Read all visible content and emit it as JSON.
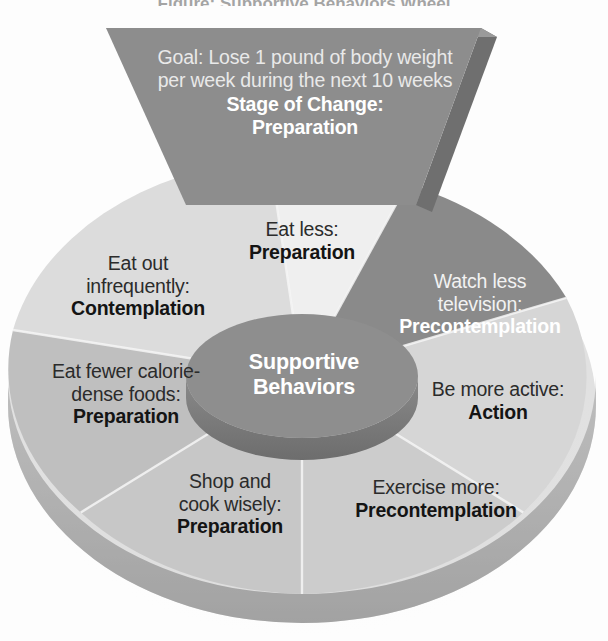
{
  "title": "Figure: Supportive Behaviors Wheel",
  "funnel": {
    "goal_text": "Goal: Lose 1 pound of body weight per week during the next 10 weeks",
    "stage_label": "Stage of Change:",
    "stage_value": "Preparation"
  },
  "hub": {
    "line1": "Supportive",
    "line2": "Behaviors"
  },
  "wheel": {
    "segments": [
      {
        "id": "eat-less",
        "behavior": "Eat less:",
        "stage": "Preparation",
        "fill": "#efefef",
        "text_tone": "dark"
      },
      {
        "id": "watch-television",
        "behavior_line1": "Watch less",
        "behavior_line2": "television:",
        "stage": "Precontemplation",
        "fill": "#8a8a8a",
        "text_tone": "light"
      },
      {
        "id": "be-more-active",
        "behavior": "Be more active:",
        "stage": "Action",
        "fill": "#d6d6d6",
        "text_tone": "dark"
      },
      {
        "id": "exercise-more",
        "behavior": "Exercise more:",
        "stage": "Precontemplation",
        "fill": "#cccccc",
        "text_tone": "dark"
      },
      {
        "id": "shop-and-cook",
        "behavior_line1": "Shop and",
        "behavior_line2": "cook wisely:",
        "stage": "Preparation",
        "fill": "#c7c7c7",
        "text_tone": "dark"
      },
      {
        "id": "eat-fewer-calorie-dense",
        "behavior_line1": "Eat fewer calorie-",
        "behavior_line2": "dense foods:",
        "stage": "Preparation",
        "fill": "#bfbfbf",
        "text_tone": "dark"
      },
      {
        "id": "eat-out-infrequently",
        "behavior_line1": "Eat out",
        "behavior_line2": "infrequently:",
        "stage": "Contemplation",
        "fill": "#dcdcdc",
        "text_tone": "dark"
      }
    ]
  },
  "colors": {
    "funnel_face": "#8d8d8d",
    "funnel_side": "#6f6f6f",
    "hub_top": "#8e8e8e",
    "hub_side": "#767676",
    "rim_light": "#bdbdbd",
    "rim_dark": "#9a9a9a",
    "background": "#fdfdfd"
  }
}
